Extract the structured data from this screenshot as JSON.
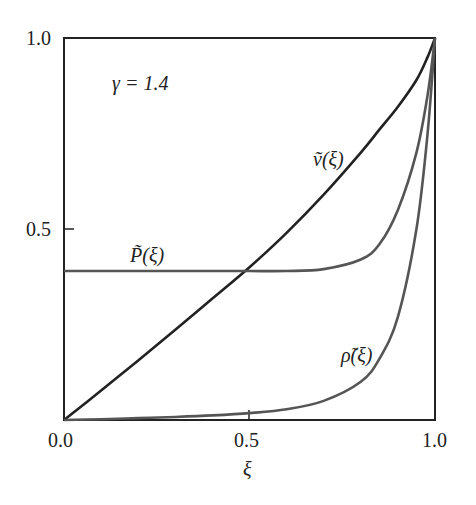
{
  "chart_data": {
    "type": "line",
    "title": "",
    "xlabel": "ξ",
    "ylabel": "",
    "xlim": [
      0,
      1
    ],
    "ylim": [
      0,
      1
    ],
    "grid": false,
    "legend": "inline labels",
    "x_ticks": [
      "0.0",
      "0.5",
      "1.0"
    ],
    "y_ticks": [
      "0.5",
      "1.0"
    ],
    "annotation": "γ = 1.4",
    "x": [
      0,
      0.1,
      0.2,
      0.3,
      0.4,
      0.5,
      0.6,
      0.7,
      0.8,
      0.85,
      0.9,
      0.95,
      0.98,
      1.0
    ],
    "series": [
      {
        "name": "ṽ(ξ)",
        "label": "ṽ(ξ)",
        "color": "#222222",
        "values": [
          0,
          0.077,
          0.156,
          0.236,
          0.318,
          0.4,
          0.49,
          0.59,
          0.7,
          0.76,
          0.82,
          0.89,
          0.95,
          1.0
        ]
      },
      {
        "name": "P̃(ξ)",
        "label": "P̃(ξ)",
        "color": "#555555",
        "values": [
          0.39,
          0.39,
          0.39,
          0.39,
          0.39,
          0.39,
          0.39,
          0.395,
          0.42,
          0.46,
          0.55,
          0.7,
          0.85,
          1.0
        ]
      },
      {
        "name": "ρ̃(ξ)",
        "label": "ρ̃(ξ)",
        "color": "#555555",
        "values": [
          0,
          0.002,
          0.005,
          0.008,
          0.012,
          0.018,
          0.028,
          0.05,
          0.1,
          0.16,
          0.27,
          0.5,
          0.75,
          1.0
        ]
      }
    ]
  },
  "labels": {
    "gamma": "γ = 1.4",
    "v": "ṽ(ξ)",
    "P": "P̃(ξ)",
    "rho": "ρ̃(ξ)",
    "xaxis": "ξ",
    "x0": "0.0",
    "x05": "0.5",
    "x1": "1.0",
    "y05": "0.5",
    "y1": "1.0"
  }
}
